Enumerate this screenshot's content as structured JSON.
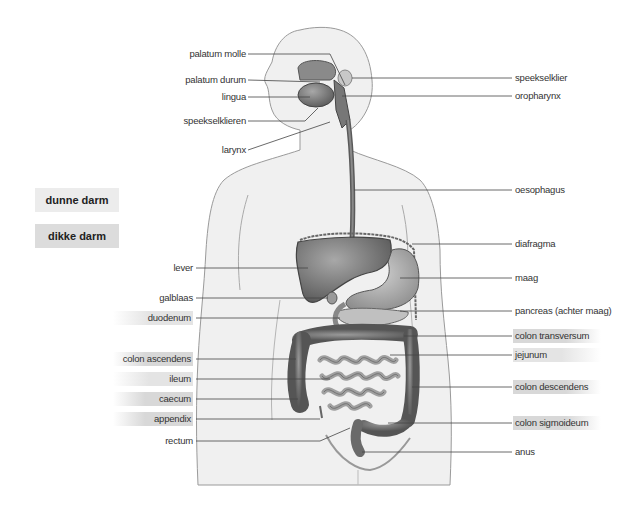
{
  "legend": {
    "small_intestine": "dunne darm",
    "large_intestine": "dikke darm"
  },
  "labels_left": [
    {
      "id": "palatum-molle",
      "text": "palatum molle",
      "highlight": false
    },
    {
      "id": "palatum-durum",
      "text": "palatum durum",
      "highlight": false
    },
    {
      "id": "lingua",
      "text": "lingua",
      "highlight": false
    },
    {
      "id": "speekselklieren",
      "text": "speekselklieren",
      "highlight": false
    },
    {
      "id": "larynx",
      "text": "larynx",
      "highlight": false
    },
    {
      "id": "lever",
      "text": "lever",
      "highlight": false
    },
    {
      "id": "galblaas",
      "text": "galblaas",
      "highlight": false
    },
    {
      "id": "duodenum",
      "text": "duodenum",
      "highlight": "dunne darm"
    },
    {
      "id": "colon-ascendens",
      "text": "colon ascendens",
      "highlight": "dikke darm"
    },
    {
      "id": "ileum",
      "text": "ileum",
      "highlight": "dunne darm"
    },
    {
      "id": "caecum",
      "text": "caecum",
      "highlight": "dikke darm"
    },
    {
      "id": "appendix",
      "text": "appendix",
      "highlight": "dikke darm"
    },
    {
      "id": "rectum",
      "text": "rectum",
      "highlight": false
    }
  ],
  "labels_right": [
    {
      "id": "speekselklier",
      "text": "speekselklier",
      "highlight": false
    },
    {
      "id": "oropharynx",
      "text": "oropharynx",
      "highlight": false
    },
    {
      "id": "oesophagus",
      "text": "oesophagus",
      "highlight": false
    },
    {
      "id": "diafragma",
      "text": "diafragma",
      "highlight": false
    },
    {
      "id": "maag",
      "text": "maag",
      "highlight": false
    },
    {
      "id": "pancreas",
      "text": "pancreas (achter maag)",
      "highlight": false
    },
    {
      "id": "colon-transversum",
      "text": "colon transversum",
      "highlight": "dikke darm"
    },
    {
      "id": "jejunum",
      "text": "jejunum",
      "highlight": "dunne darm"
    },
    {
      "id": "colon-descendens",
      "text": "colon descendens",
      "highlight": "dikke darm"
    },
    {
      "id": "colon-sigmoideum",
      "text": "colon sigmoideum",
      "highlight": "dikke darm"
    },
    {
      "id": "anus",
      "text": "anus",
      "highlight": false
    }
  ],
  "colors": {
    "body_fill": "#f0f0f0",
    "body_outline": "#9a9a9a",
    "organ_dark": "#6a6a6a",
    "organ_mid": "#8c8c8c",
    "organ_light": "#b8b8b8",
    "leader_line": "#444444",
    "small_intestine_key": "#ececec",
    "large_intestine_key": "#dcdcdc"
  }
}
